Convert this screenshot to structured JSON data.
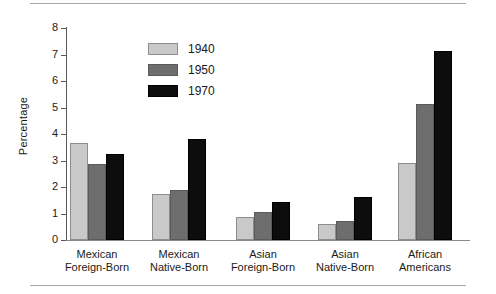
{
  "chart_data": {
    "type": "bar",
    "title": "",
    "xlabel": "",
    "ylabel": "Percentage",
    "ylim": [
      0,
      8
    ],
    "ytick_labels": [
      "0",
      "1",
      "2",
      "3",
      "4",
      "5",
      "6",
      "7",
      "8"
    ],
    "grid": false,
    "legend_position": "upper-center",
    "categories": [
      "Mexican\nForeign-Born",
      "Mexican\nNative-Born",
      "Asian\nForeign-Born",
      "Asian\nNative-Born",
      "African\nAmericans"
    ],
    "category_lines": [
      [
        "Mexican",
        "Foreign-Born"
      ],
      [
        "Mexican",
        "Native-Born"
      ],
      [
        "Asian",
        "Foreign-Born"
      ],
      [
        "Asian",
        "Native-Born"
      ],
      [
        "African",
        "Americans"
      ]
    ],
    "series": [
      {
        "name": "1940",
        "color": "#c9c9c9",
        "values": [
          3.65,
          1.75,
          0.88,
          0.6,
          2.9
        ]
      },
      {
        "name": "1950",
        "color": "#6e6e6e",
        "values": [
          2.88,
          1.88,
          1.05,
          0.7,
          5.15
        ]
      },
      {
        "name": "1970",
        "color": "#0d0d0d",
        "values": [
          3.25,
          3.82,
          1.45,
          1.62,
          7.15
        ]
      }
    ]
  },
  "legend": {
    "entries": [
      {
        "label": "1940",
        "swatch": "c1940"
      },
      {
        "label": "1950",
        "swatch": "c1950"
      },
      {
        "label": "1970",
        "swatch": "c1970"
      }
    ]
  },
  "axis": {
    "y_title": "Percentage"
  }
}
